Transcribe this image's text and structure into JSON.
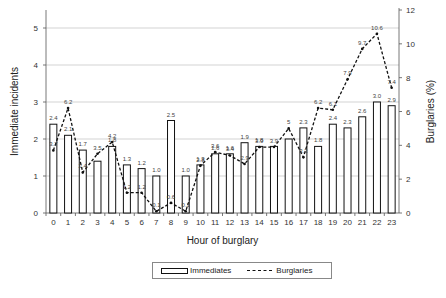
{
  "chart_data": {
    "type": "bar+line",
    "title": "",
    "xlabel": "Hour of burglary",
    "ylabel": "Immediate incidents",
    "y2label": "Burglaries (%)",
    "categories": [
      "0",
      "1",
      "2",
      "3",
      "4",
      "5",
      "6",
      "7",
      "8",
      "9",
      "10",
      "11",
      "12",
      "13",
      "14",
      "15",
      "16",
      "17",
      "18",
      "19",
      "20",
      "21",
      "22",
      "23"
    ],
    "series": [
      {
        "name": "Immediates",
        "type": "bar",
        "axis": "left",
        "values": [
          2.4,
          2.1,
          1.7,
          1.4,
          1.8,
          1.3,
          1.2,
          1.0,
          2.5,
          1.0,
          1.3,
          1.6,
          1.6,
          1.9,
          1.8,
          1.8,
          2.0,
          2.3,
          1.8,
          2.4,
          2.3,
          2.6,
          3.0,
          2.9
        ],
        "labels": [
          "2.4",
          "2.1",
          "1.7",
          "",
          "1.8",
          "1.3",
          "1.2",
          "1.0",
          "2.5",
          "1.0",
          "1.3",
          "1.6",
          "1.6",
          "1.9",
          "1.8",
          "",
          "",
          "2.3",
          "1.8",
          "2.4",
          "2.3",
          "2.6",
          "3.0",
          "2.9"
        ]
      },
      {
        "name": "Burglaries",
        "type": "line",
        "style": "dashed",
        "axis": "right",
        "values": [
          3.7,
          6.2,
          2.4,
          3.5,
          4.2,
          1.2,
          1.2,
          0.1,
          0.6,
          0.1,
          2.8,
          3.6,
          3.4,
          2.9,
          3.9,
          3.9,
          5.0,
          3.3,
          6.2,
          6.1,
          7.9,
          9.7,
          10.6,
          7.4
        ],
        "labels": [
          "3.7",
          "6.2",
          "2.4",
          "3.5",
          "4.2",
          "1.2",
          "1.2",
          "0.1",
          "0.6",
          "0.1",
          "2.8",
          "3.6",
          "3.4",
          "2.9",
          "3.9",
          "3.9",
          "5",
          "3.3",
          "6.2",
          "6.1",
          "7.9",
          "9.7",
          "10.6",
          "7.4"
        ]
      }
    ],
    "ylim": [
      0,
      5.5
    ],
    "y_ticks": [
      "0",
      "1",
      "2",
      "3",
      "4",
      "5"
    ],
    "y2lim": [
      0,
      12
    ],
    "y2_ticks": [
      "0",
      "2",
      "4",
      "6",
      "8",
      "10",
      "12"
    ],
    "grid": "horizontal",
    "legend_position": "bottom"
  },
  "legend": {
    "immediates": "Immediates",
    "burglaries": "Burglaries"
  }
}
